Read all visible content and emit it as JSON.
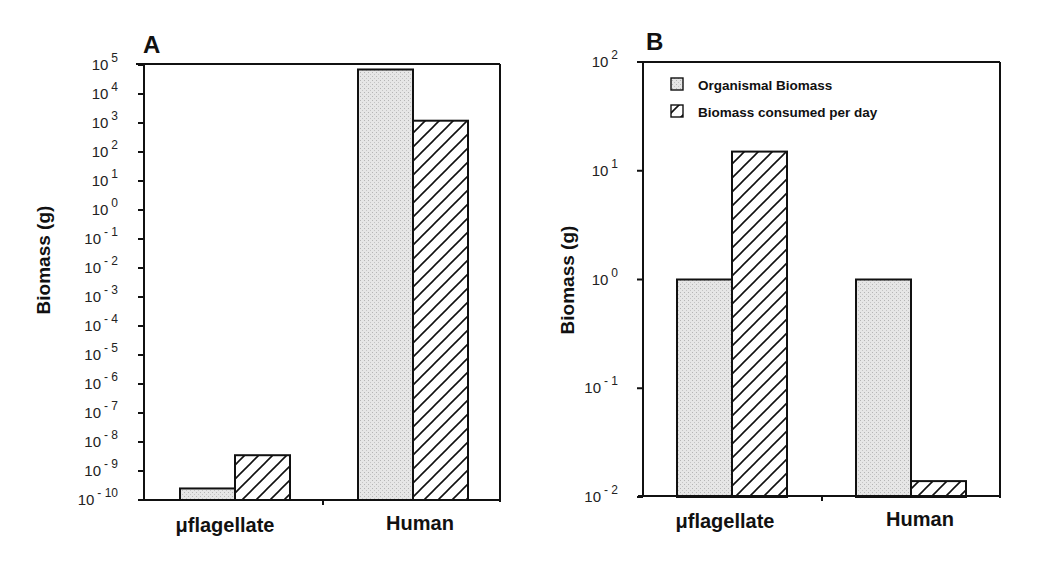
{
  "panels": {
    "A": {
      "letter": "A",
      "ylabel": "Biomass  (g)",
      "categories": [
        "μflagellate",
        "Human"
      ]
    },
    "B": {
      "letter": "B",
      "ylabel": "Biomass  (g)",
      "categories": [
        "μflagellate",
        "Human"
      ]
    }
  },
  "legend": {
    "items": [
      {
        "label": "Organismal Biomass",
        "pattern": "stipple"
      },
      {
        "label": "Biomass consumed per day",
        "pattern": "hatch"
      }
    ]
  },
  "colors": {
    "stipple": "#e4e4e4",
    "stroke": "#111111",
    "background": "#ffffff"
  },
  "chart_data": [
    {
      "type": "bar",
      "panel": "A",
      "title": "A",
      "xlabel": "",
      "ylabel": "Biomass (g)",
      "yscale": "log",
      "ylim": [
        1e-10,
        100000.0
      ],
      "yticks": [
        "10^5",
        "10^4",
        "10^3",
        "10^2",
        "10^1",
        "10^0",
        "10^-1",
        "10^-2",
        "10^-3",
        "10^-4",
        "10^-5",
        "10^-6",
        "10^-7",
        "10^-8",
        "10^-9",
        "10^-10"
      ],
      "categories": [
        "μflagellate",
        "Human"
      ],
      "series": [
        {
          "name": "Organismal Biomass",
          "values": [
            2.5e-10,
            70000
          ]
        },
        {
          "name": "Biomass consumed per day",
          "values": [
            3.5e-09,
            1200
          ]
        }
      ],
      "legend_position": "none",
      "grid": false
    },
    {
      "type": "bar",
      "panel": "B",
      "title": "B",
      "xlabel": "",
      "ylabel": "Biomass (g)",
      "yscale": "log",
      "ylim": [
        0.01,
        100
      ],
      "yticks": [
        "10^2",
        "10^1",
        "10^0",
        "10^-1",
        "10^-2"
      ],
      "categories": [
        "μflagellate",
        "Human"
      ],
      "series": [
        {
          "name": "Organismal Biomass",
          "values": [
            1,
            1
          ]
        },
        {
          "name": "Biomass consumed per day",
          "values": [
            15,
            0.014
          ]
        }
      ],
      "legend_position": "upper left",
      "grid": false
    }
  ]
}
